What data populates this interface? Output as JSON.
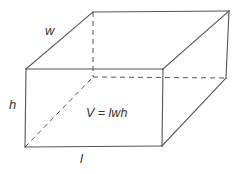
{
  "diagram": {
    "type": "rectangular-prism",
    "labels": {
      "width": "w",
      "height": "h",
      "length": "l",
      "formula": "V = lwh"
    },
    "colors": {
      "line": "#555555",
      "text": "#333333",
      "background": "#ffffff"
    },
    "vertices": {
      "front_top_left": [
        26,
        69
      ],
      "front_top_right": [
        163,
        69
      ],
      "front_bottom_left": [
        25,
        147
      ],
      "front_bottom_right": [
        162,
        146
      ],
      "back_top_left": [
        93,
        12
      ],
      "back_top_right": [
        229,
        11
      ],
      "back_bottom_left": [
        93,
        77
      ],
      "back_bottom_right": [
        226,
        78
      ]
    },
    "visible_edges": 9,
    "hidden_edges": 3
  }
}
